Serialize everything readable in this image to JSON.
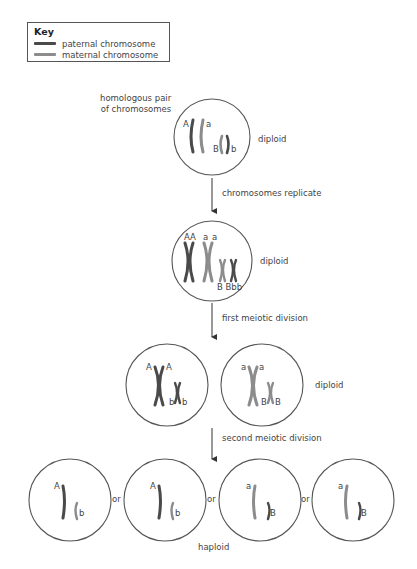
{
  "key": {
    "title": "Key",
    "items": [
      {
        "label": "paternal chromosome",
        "color": "#4a4a4a"
      },
      {
        "label": "maternal chromosome",
        "color": "#8c8c8c"
      }
    ]
  },
  "stages": {
    "homologous_label_line1": "homologous pair",
    "homologous_label_line2": "of chromosomes",
    "diploid_1": "diploid",
    "step_1": "chromosomes replicate",
    "diploid_2": "diploid",
    "step_2": "first meiotic division",
    "diploid_3": "diploid",
    "step_3": "second meiotic division",
    "or_1": "or",
    "or_2": "or",
    "or_3": "or",
    "haploid": "haploid"
  },
  "alleles": {
    "cell1": {
      "A": "A",
      "a": "a",
      "B": "B",
      "b": "b"
    },
    "cell2": {
      "AA": "AA",
      "a1": "a",
      "a2": "a",
      "BBbb": "B Bbb"
    },
    "cell3_left": {
      "A1": "A",
      "A2": "A",
      "b1": "b",
      "b2": "b"
    },
    "cell3_right": {
      "a1": "a",
      "a2": "a",
      "B1": "B",
      "B2": "B"
    },
    "cell4": [
      {
        "top": "A",
        "bottom": "b"
      },
      {
        "top": "A",
        "bottom": "b"
      },
      {
        "top": "a",
        "bottom": "B"
      },
      {
        "top": "a",
        "bottom": "B"
      }
    ]
  },
  "colors": {
    "paternal": "#4a4a4a",
    "maternal": "#8c8c8c",
    "outline": "#555555"
  }
}
